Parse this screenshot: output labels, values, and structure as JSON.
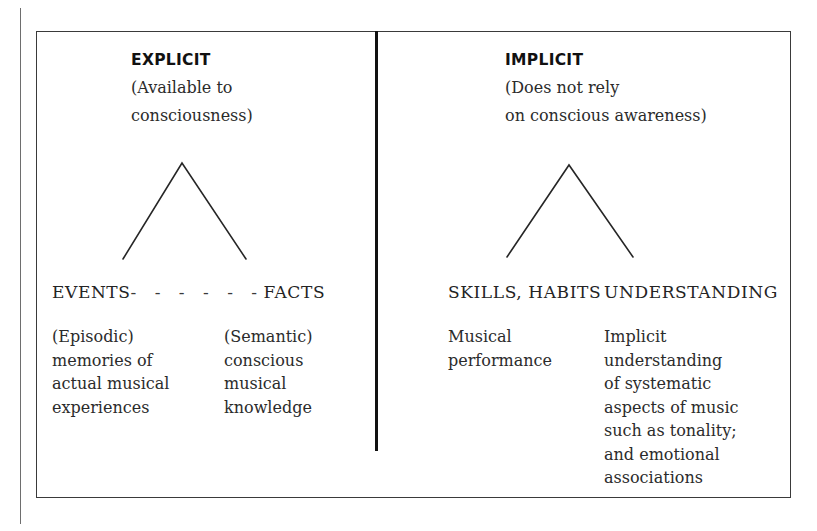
{
  "figure": {
    "type": "two-branch memory taxonomy diagram",
    "panels": [
      {
        "id": "explicit",
        "heading": "EXPLICIT",
        "subtitle_lines": [
          "(Available to",
          "consciousness)"
        ],
        "branch_symbol": "chevron",
        "categories": {
          "left_label": "EVENTS",
          "connector": "- - - - - -",
          "right_label": "FACTS"
        },
        "descriptions": [
          {
            "id": "episodic",
            "lines": [
              "(Episodic)",
              "memories of",
              "actual musical",
              "experiences"
            ]
          },
          {
            "id": "semantic",
            "lines": [
              "(Semantic)",
              "conscious",
              "musical",
              "knowledge"
            ]
          }
        ]
      },
      {
        "id": "implicit",
        "heading": "IMPLICIT",
        "subtitle_lines": [
          "(Does not rely",
          "on conscious awareness)"
        ],
        "branch_symbol": "chevron",
        "categories": {
          "left_label": "SKILLS, HABITS",
          "connector": "",
          "right_label": "UNDERSTANDING"
        },
        "descriptions": [
          {
            "id": "skills-habits",
            "lines": [
              "Musical",
              "performance"
            ]
          },
          {
            "id": "understanding",
            "lines": [
              "Implicit",
              "understanding",
              "of systematic",
              "aspects of music",
              "such as tonality;",
              "and emotional",
              "associations"
            ]
          }
        ]
      }
    ],
    "colors": {
      "ink": "#1a1a1a",
      "rule": "#3a3a3a",
      "divider": "#111111",
      "background": "#ffffff"
    }
  }
}
